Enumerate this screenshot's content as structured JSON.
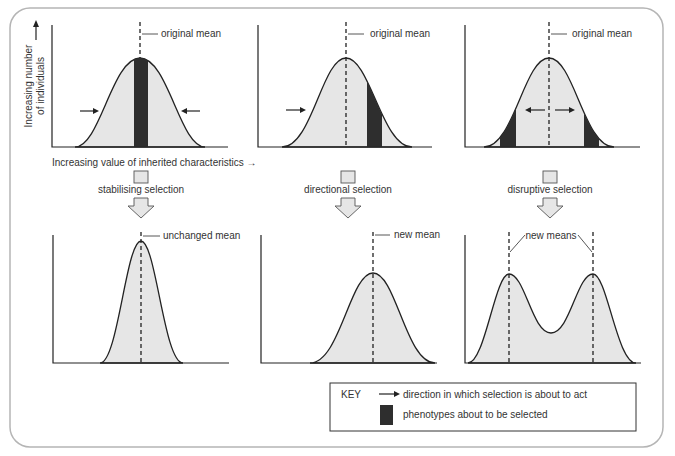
{
  "figure": {
    "y_axis_label_line1": "Increasing number",
    "y_axis_label_line2": "of individuals",
    "x_axis_label": "Increasing value of inherited characteristics →",
    "panels_top": [
      {
        "mean_label": "original mean",
        "selection_label": "stabilising selection"
      },
      {
        "mean_label": "original mean",
        "selection_label": "directional selection"
      },
      {
        "mean_label": "original mean",
        "selection_label": "disruptive selection"
      }
    ],
    "panels_bottom": [
      {
        "mean_label": "unchanged mean"
      },
      {
        "mean_label": "new mean"
      },
      {
        "mean_label": "new means"
      }
    ],
    "key": {
      "title": "KEY",
      "arrow_text": "direction in which selection is about to act",
      "block_text": "phenotypes about to be selected"
    },
    "colors": {
      "curve_fill": "#e6e6e6",
      "selected_fill": "#2e2e2e",
      "frame": "#b5b5b5"
    }
  }
}
